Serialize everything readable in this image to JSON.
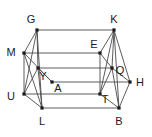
{
  "figure": {
    "kind": "geometry-diagram",
    "stroke_color": "#4a4a4a",
    "vertex_color": "#1a1a1a",
    "background_color": "#ffffff",
    "width": 152,
    "height": 137,
    "vertices": [
      {
        "label": "G",
        "x": 37,
        "y": 30,
        "label_x": 31,
        "label_y": 19
      },
      {
        "label": "K",
        "x": 114,
        "y": 30,
        "label_x": 114,
        "label_y": 19
      },
      {
        "label": "M",
        "x": 24,
        "y": 53,
        "label_x": 11,
        "label_y": 52
      },
      {
        "label": "E",
        "x": 100,
        "y": 53,
        "label_x": 94,
        "label_y": 44
      },
      {
        "label": "Y",
        "x": 38,
        "y": 68,
        "label_x": 43,
        "label_y": 76
      },
      {
        "label": "Q",
        "x": 112,
        "y": 68,
        "label_x": 120,
        "label_y": 70
      },
      {
        "label": "H",
        "x": 130,
        "y": 82,
        "label_x": 140,
        "label_y": 82
      },
      {
        "label": "A",
        "x": 52,
        "y": 82,
        "label_x": 58,
        "label_y": 88
      },
      {
        "label": "U",
        "x": 24,
        "y": 94,
        "label_x": 11,
        "label_y": 96
      },
      {
        "label": "T",
        "x": 100,
        "y": 94,
        "label_x": 105,
        "label_y": 99
      },
      {
        "label": "L",
        "x": 42,
        "y": 108,
        "label_x": 42,
        "label_y": 121
      },
      {
        "label": "B",
        "x": 119,
        "y": 108,
        "label_x": 119,
        "label_y": 121
      }
    ],
    "edges": [
      {
        "from": "G",
        "to": "K"
      },
      {
        "from": "G",
        "to": "M"
      },
      {
        "from": "G",
        "to": "Y"
      },
      {
        "from": "G",
        "to": "U"
      },
      {
        "from": "G",
        "to": "L"
      },
      {
        "from": "K",
        "to": "E"
      },
      {
        "from": "K",
        "to": "Q"
      },
      {
        "from": "K",
        "to": "T"
      },
      {
        "from": "K",
        "to": "B"
      },
      {
        "from": "K",
        "to": "H"
      },
      {
        "from": "M",
        "to": "E"
      },
      {
        "from": "M",
        "to": "U"
      },
      {
        "from": "M",
        "to": "A"
      },
      {
        "from": "M",
        "to": "L"
      },
      {
        "from": "E",
        "to": "Q"
      },
      {
        "from": "E",
        "to": "T"
      },
      {
        "from": "Y",
        "to": "Q"
      },
      {
        "from": "Y",
        "to": "A"
      },
      {
        "from": "Y",
        "to": "U"
      },
      {
        "from": "Y",
        "to": "L"
      },
      {
        "from": "A",
        "to": "H"
      },
      {
        "from": "Q",
        "to": "H"
      },
      {
        "from": "Q",
        "to": "T"
      },
      {
        "from": "Q",
        "to": "B"
      },
      {
        "from": "U",
        "to": "T"
      },
      {
        "from": "U",
        "to": "L"
      },
      {
        "from": "T",
        "to": "B"
      },
      {
        "from": "L",
        "to": "B"
      },
      {
        "from": "H",
        "to": "B"
      }
    ]
  }
}
